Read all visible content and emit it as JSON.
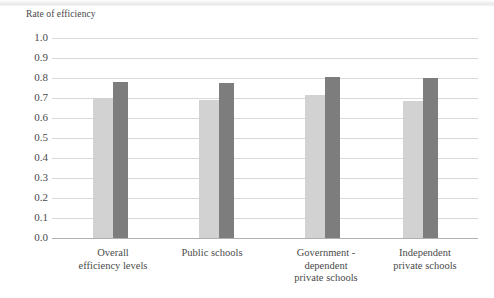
{
  "chart_data": {
    "type": "bar",
    "title": "",
    "xlabel": "",
    "ylabel": "Rate of efficiency",
    "ylim": [
      0.0,
      1.0
    ],
    "grid": true,
    "legend": "none",
    "categories": [
      "Overall efficiency levels",
      "Public schools",
      "Government - dependent private schools",
      "Independent private schools"
    ],
    "category_lines": [
      [
        "Overall",
        "efficiency levels"
      ],
      [
        "Public schools"
      ],
      [
        "Government -",
        "dependent",
        "private schools"
      ],
      [
        "Independent",
        "private schools"
      ]
    ],
    "series": [
      {
        "name": "light-series",
        "color": "#d2d2d2",
        "values": [
          0.7,
          0.69,
          0.715,
          0.685
        ]
      },
      {
        "name": "dark-series",
        "color": "#7d7d7d",
        "values": [
          0.78,
          0.775,
          0.805,
          0.8
        ]
      }
    ],
    "ytick_labels": [
      "1.0",
      "0.9",
      "0.8",
      "0.7",
      "0.6",
      "0.5",
      "0.4",
      "0.3",
      "0.2",
      "0.1",
      "0.0"
    ],
    "ytick_values": [
      1.0,
      0.9,
      0.8,
      0.7,
      0.6,
      0.5,
      0.4,
      0.3,
      0.2,
      0.1,
      0.0
    ]
  },
  "colors": {
    "gridline": "#d9d9d9",
    "baseline": "#b0b0b0",
    "text": "#4a4a4a",
    "light_bar": "#d2d2d2",
    "dark_bar": "#7d7d7d"
  }
}
